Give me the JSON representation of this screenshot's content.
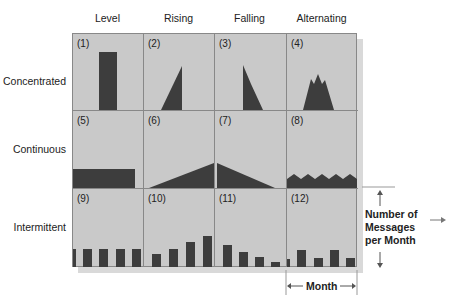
{
  "columns": [
    "Level",
    "Rising",
    "Falling",
    "Alternating"
  ],
  "rows": [
    "Concentrated",
    "Continuous",
    "Intermittent"
  ],
  "cells": [
    "(1)",
    "(2)",
    "(3)",
    "(4)",
    "(5)",
    "(6)",
    "(7)",
    "(8)",
    "(9)",
    "(10)",
    "(11)",
    "(12)"
  ],
  "annotations": {
    "y_axis_label": "Number of Messages per Month",
    "y_axis_label_lines": [
      "Number of",
      "Messages",
      "per Month"
    ],
    "x_axis_label": "Month"
  },
  "colors": {
    "cell_bg": "#c9c9c9",
    "fill": "#3d3d3d",
    "border": "#888888"
  }
}
